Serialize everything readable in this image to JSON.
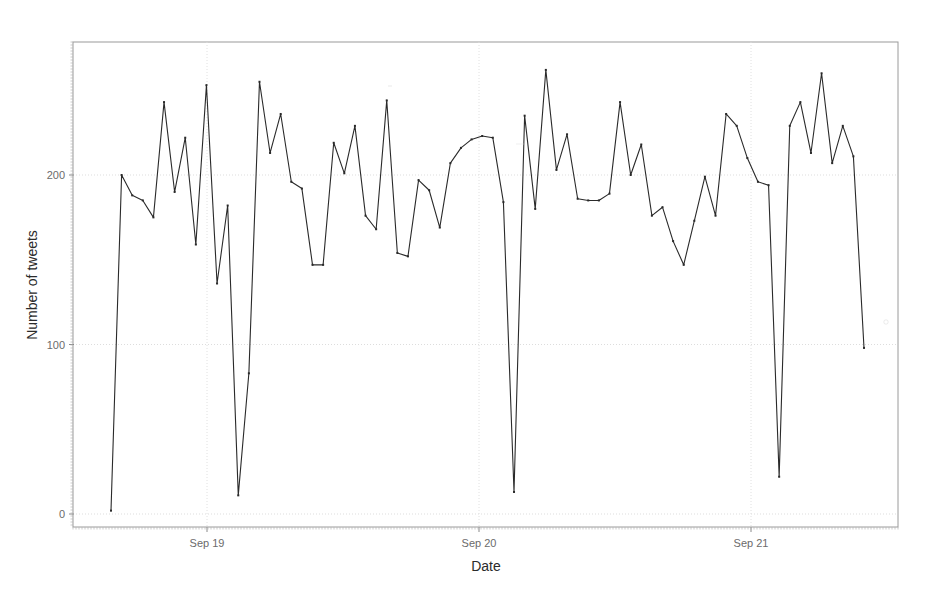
{
  "chart_data": {
    "type": "line",
    "title": "",
    "subtitle": "",
    "xlabel": "Date",
    "ylabel": "Number of tweets",
    "grid": true,
    "legend": null,
    "xtick_labels": [
      "Sep 19",
      "Sep 20",
      "Sep 21"
    ],
    "xtick_positions_px": [
      207,
      479,
      751
    ],
    "ytick_labels": [
      "0",
      "100",
      "200"
    ],
    "ytick_values": [
      0,
      100,
      200
    ],
    "ylim": [
      0,
      260
    ],
    "xlim_note": "hourly samples spanning ~Sep 18 17:00 to ~Sep 21 16:00",
    "series": [
      {
        "name": "tweets per hour",
        "marker": "dot",
        "color": "#2a2a2a",
        "values": [
          2,
          200,
          188,
          185,
          175,
          243,
          190,
          222,
          159,
          253,
          136,
          182,
          11,
          83,
          255,
          213,
          236,
          196,
          192,
          147,
          147,
          219,
          201,
          229,
          176,
          168,
          244,
          154,
          152,
          197,
          191,
          169,
          207,
          216,
          221,
          223,
          222,
          184,
          13,
          235,
          180,
          262,
          203,
          224,
          186,
          185,
          185,
          189,
          243,
          200,
          218,
          176,
          181,
          161,
          147,
          173,
          199,
          176,
          236,
          229,
          210,
          196,
          194,
          22,
          229,
          243,
          213,
          260,
          207,
          229,
          211,
          98
        ]
      }
    ]
  },
  "axes": {
    "y_axis_title": "Number of tweets",
    "x_axis_title": "Date"
  },
  "frame": {
    "left_px": 73,
    "top_px": 42,
    "right_px": 898,
    "bottom_px": 527
  }
}
